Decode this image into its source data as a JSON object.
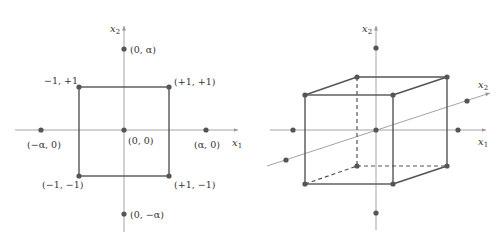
{
  "colors": {
    "axis": "#9a9a9a",
    "edge": "#555555",
    "point": "#555555",
    "text": "#333333"
  },
  "left_diagram": {
    "title": "Central composite design (2 factors)",
    "axis_x": {
      "label": "x",
      "subscript": "1"
    },
    "axis_y": {
      "label": "x",
      "subscript": "2"
    },
    "points": [
      {
        "id": "corner-tl",
        "label": "−1, +1"
      },
      {
        "id": "corner-tr",
        "label": "(+1, +1)"
      },
      {
        "id": "corner-bl",
        "label": "(−1, −1)"
      },
      {
        "id": "corner-br",
        "label": "(+1, −1)"
      },
      {
        "id": "center",
        "label": "(0, 0)"
      },
      {
        "id": "axial-left",
        "label": "(−α, 0)"
      },
      {
        "id": "axial-right",
        "label": "(α, 0)"
      },
      {
        "id": "axial-top",
        "label": "(0, α)"
      },
      {
        "id": "axial-bottom",
        "label": "(0, −α)"
      }
    ]
  },
  "right_diagram": {
    "title": "Central composite design (3 factors)",
    "axis_x": {
      "label": "x",
      "subscript": "1"
    },
    "axis_y": {
      "label": "x",
      "subscript": "2"
    },
    "axis_z": {
      "label": "x",
      "subscript": "2"
    }
  }
}
